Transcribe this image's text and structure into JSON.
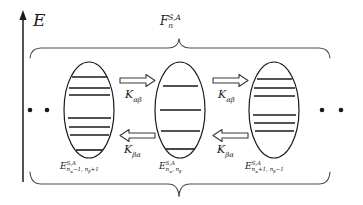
{
  "figure": {
    "type": "energy-level-diagram",
    "background_color": "#ffffff",
    "line_color": "#1a1a1a",
    "axis": {
      "name": "energy-axis",
      "label": "E",
      "direction": "up"
    },
    "top_brace": {
      "name": "manifold-brace-top",
      "label_base": "F",
      "label_superscript": "S,A",
      "label_subscript": "n"
    },
    "bottom_brace": {
      "name": "manifold-brace-bottom",
      "label": ""
    },
    "ellipses": [
      {
        "id": "left",
        "name": "state-group-left",
        "label_base": "E",
        "label_superscript": "S,A",
        "label_subscript": "n",
        "subscript_detail_1": "α",
        "subscript_detail_2": "−1, n",
        "subscript_detail_3": "β",
        "subscript_detail_4": "+1",
        "level_count": 7,
        "levels": [
          0.16,
          0.27,
          0.36,
          0.6,
          0.69,
          0.78,
          0.93
        ]
      },
      {
        "id": "middle",
        "name": "state-group-middle",
        "label_base": "E",
        "label_superscript": "S,A",
        "label_subscript": "n",
        "subscript_detail_1": "α",
        "subscript_detail_2": ", n",
        "subscript_detail_3": "β",
        "subscript_detail_4": "",
        "level_count": 4,
        "levels": [
          0.25,
          0.5,
          0.72,
          0.9
        ]
      },
      {
        "id": "right",
        "name": "state-group-right",
        "label_base": "E",
        "label_superscript": "S,A",
        "label_subscript": "n",
        "subscript_detail_1": "α",
        "subscript_detail_2": "+1, n",
        "subscript_detail_3": "β",
        "subscript_detail_4": "−1",
        "level_count": 6,
        "levels": [
          0.17,
          0.26,
          0.4,
          0.49,
          0.62,
          0.7
        ]
      }
    ],
    "arrows": [
      {
        "name": "arrow-forward-left",
        "glyph": "double-arrow-right",
        "direction": "right",
        "label_base": "K",
        "label_subscript": "αβ"
      },
      {
        "name": "arrow-backward-left",
        "glyph": "double-arrow-left",
        "direction": "left",
        "label_base": "K",
        "label_subscript": "βα"
      },
      {
        "name": "arrow-forward-right",
        "glyph": "double-arrow-right",
        "direction": "right",
        "label_base": "K",
        "label_subscript": "αβ"
      },
      {
        "name": "arrow-backward-right",
        "glyph": "double-arrow-left",
        "direction": "left",
        "label_base": "K",
        "label_subscript": "βα"
      }
    ],
    "ellipsis_dots": {
      "name": "continuation-dots",
      "left_count": 2,
      "right_count": 2,
      "glyph": "dot"
    }
  }
}
